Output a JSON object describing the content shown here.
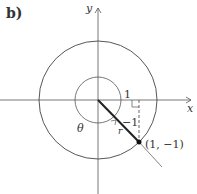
{
  "panel_label": "b)",
  "axes": {
    "x_label": "x",
    "y_label": "y"
  },
  "labels": {
    "one": "1",
    "minus_one": "−1",
    "theta": "θ",
    "r": "r",
    "point": "(1, −1)"
  },
  "colors": {
    "stroke": "#333333",
    "background": "#ffffff"
  }
}
